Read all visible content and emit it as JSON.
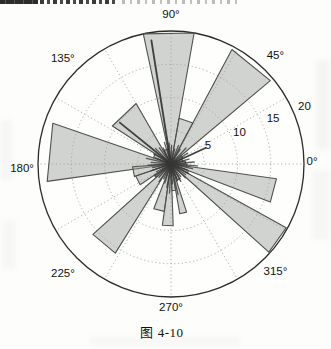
{
  "figure": {
    "caption": "图 4-10"
  },
  "chart_data": {
    "type": "polar-rose",
    "title": "",
    "angle_unit": "degrees",
    "radial_max": 20,
    "radial_ticks": [
      5,
      10,
      15,
      20
    ],
    "grid": {
      "dotted_rings": [
        5,
        10,
        15
      ],
      "outer_solid_ring": 20,
      "spoke_step_deg": 30
    },
    "angle_tick_labels": [
      {
        "label": "0°",
        "angle": 0.8,
        "r": 21.2
      },
      {
        "label": "45°",
        "angle": 46,
        "r": 22.6
      },
      {
        "label": "90°",
        "angle": 90,
        "r": 22.4
      },
      {
        "label": "135°",
        "angle": 135.8,
        "r": 22.7
      },
      {
        "label": "180°",
        "angle": 182,
        "r": 22.4
      },
      {
        "label": "225°",
        "angle": 225.5,
        "r": 23.2
      },
      {
        "label": "270°",
        "angle": 270,
        "r": 21.6
      },
      {
        "label": "315°",
        "angle": 314,
        "r": 22.6
      }
    ],
    "radial_tick_labels": [
      {
        "label": "5",
        "angle": 26.5,
        "r": 6.2
      },
      {
        "label": "10",
        "angle": 24.5,
        "r": 11.3
      },
      {
        "label": "15",
        "angle": 24.0,
        "r": 16.8
      },
      {
        "label": "20",
        "angle": 23.0,
        "r": 21.8
      }
    ],
    "wedges": [
      {
        "start": 80,
        "end": 102,
        "r": 20.0
      },
      {
        "start": 62,
        "end": 80,
        "r": 7.0
      },
      {
        "start": 40,
        "end": 62,
        "r": 19.5
      },
      {
        "start": 120,
        "end": 147,
        "r": 10.5
      },
      {
        "start": 161,
        "end": 188,
        "r": 18.8
      },
      {
        "start": 184,
        "end": 199,
        "r": 5.8
      },
      {
        "start": 199,
        "end": 214,
        "r": 5.6
      },
      {
        "start": 222,
        "end": 238,
        "r": 15.8
      },
      {
        "start": 249,
        "end": 262,
        "r": 7.2
      },
      {
        "start": 262,
        "end": 272,
        "r": 9.3
      },
      {
        "start": 280,
        "end": 288,
        "r": 7.6
      },
      {
        "start": 318,
        "end": 331,
        "r": 19.8
      },
      {
        "start": 339,
        "end": 352,
        "r": 16.0
      },
      {
        "start": 0,
        "end": 12,
        "r": 2.2
      },
      {
        "start": 12,
        "end": 26,
        "r": 1.8
      },
      {
        "start": 26,
        "end": 40,
        "r": 2.0
      },
      {
        "start": 104,
        "end": 118,
        "r": 2.3
      },
      {
        "start": 148,
        "end": 160,
        "r": 2.8
      },
      {
        "start": 214,
        "end": 222,
        "r": 3.0
      },
      {
        "start": 272,
        "end": 280,
        "r": 4.0
      },
      {
        "start": 292,
        "end": 302,
        "r": 2.6
      },
      {
        "start": 331,
        "end": 339,
        "r": 2.8
      },
      {
        "start": 352,
        "end": 360,
        "r": 2.4
      }
    ],
    "rays": [
      {
        "angle": 99,
        "r": 18.8
      },
      {
        "angle": 141,
        "r": 9.9
      },
      {
        "angle": 25,
        "r": 5.7
      },
      {
        "angle": 5,
        "r": 3.5
      },
      {
        "angle": 15,
        "r": 2.8
      },
      {
        "angle": 33,
        "r": 3.0
      },
      {
        "angle": 47,
        "r": 3.3
      },
      {
        "angle": 58,
        "r": 2.6
      },
      {
        "angle": 68,
        "r": 3.0
      },
      {
        "angle": 76,
        "r": 2.3
      },
      {
        "angle": 88,
        "r": 2.8
      },
      {
        "angle": 95,
        "r": 3.2
      },
      {
        "angle": 107,
        "r": 3.4
      },
      {
        "angle": 116,
        "r": 2.7
      },
      {
        "angle": 126,
        "r": 3.0
      },
      {
        "angle": 135,
        "r": 3.3
      },
      {
        "angle": 150,
        "r": 3.0
      },
      {
        "angle": 158,
        "r": 2.5
      },
      {
        "angle": 167,
        "r": 3.8
      },
      {
        "angle": 175,
        "r": 3.0
      },
      {
        "angle": 183,
        "r": 3.4
      },
      {
        "angle": 191,
        "r": 2.8
      },
      {
        "angle": 199,
        "r": 3.1
      },
      {
        "angle": 208,
        "r": 2.5
      },
      {
        "angle": 217,
        "r": 3.0
      },
      {
        "angle": 228,
        "r": 2.7
      },
      {
        "angle": 236,
        "r": 3.2
      },
      {
        "angle": 244,
        "r": 2.5
      },
      {
        "angle": 252,
        "r": 3.0
      },
      {
        "angle": 260,
        "r": 3.6
      },
      {
        "angle": 267,
        "r": 4.4
      },
      {
        "angle": 274,
        "r": 3.0
      },
      {
        "angle": 283,
        "r": 4.7
      },
      {
        "angle": 291,
        "r": 2.7
      },
      {
        "angle": 299,
        "r": 3.0
      },
      {
        "angle": 308,
        "r": 2.4
      },
      {
        "angle": 316,
        "r": 3.0
      },
      {
        "angle": 324,
        "r": 2.7
      },
      {
        "angle": 332,
        "r": 3.0
      },
      {
        "angle": 340,
        "r": 2.6
      },
      {
        "angle": 348,
        "r": 3.3
      },
      {
        "angle": 356,
        "r": 4.0
      }
    ],
    "colors": {
      "wedge_fill": "#9aa096",
      "wedge_stroke": "#4f524c",
      "outer_circle": "#2b2b2b",
      "grid": "#9a9a9a",
      "ray": "#373737",
      "text": "#111111"
    }
  }
}
